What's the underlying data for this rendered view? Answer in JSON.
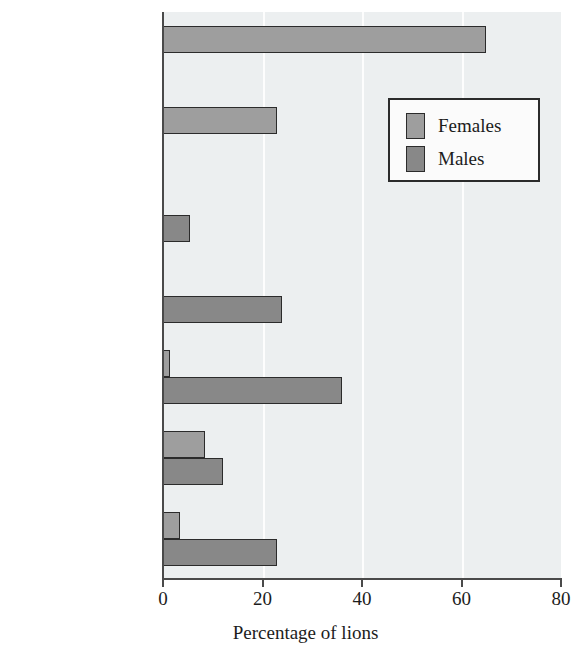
{
  "chart_data": {
    "type": "bar",
    "orientation": "horizontal",
    "title": "",
    "xlabel": "Percentage of lions",
    "ylabel": "",
    "xlim": [
      0,
      80
    ],
    "xticks": [
      0,
      20,
      40,
      60,
      80
    ],
    "xtick_labels": [
      "0",
      "20",
      "40",
      "60",
      "80"
    ],
    "grid": true,
    "grid_axis": "x",
    "legend_position": "upper right",
    "categories": [
      "Remained in\nnatal pride",
      "Formed new\npride",
      "Transferred to\nanother pride",
      "Nomads",
      "Left area",
      "Died",
      "Disappeared"
    ],
    "series": [
      {
        "name": "Females",
        "color": "#9e9e9e",
        "values": [
          65,
          23,
          0,
          0,
          1.5,
          8.5,
          3.5
        ]
      },
      {
        "name": "Males",
        "color": "#888888",
        "values": [
          0,
          0,
          5.5,
          24,
          36,
          12,
          23
        ]
      }
    ]
  },
  "legend": {
    "entries": [
      {
        "label": "Females",
        "swatch": "female"
      },
      {
        "label": "Males",
        "swatch": "male"
      }
    ]
  },
  "colors": {
    "plot_background": "#eceff0",
    "gridline": "#fdfdfd",
    "axis": "#4a4a4a",
    "bar_outline": "#2b2b2b",
    "text": "#1c1c1c",
    "page_background": "#ffffff"
  }
}
